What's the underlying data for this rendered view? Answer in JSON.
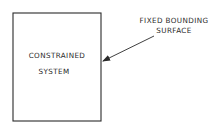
{
  "diagram": {
    "box": {
      "label_line1": "CONSTRAINED",
      "label_line2": "SYSTEM"
    },
    "annotation": {
      "label_line1": "FIXED BOUNDING",
      "label_line2": "SURFACE"
    },
    "colors": {
      "stroke": "#2a2a2a",
      "background": "#ffffff"
    }
  }
}
